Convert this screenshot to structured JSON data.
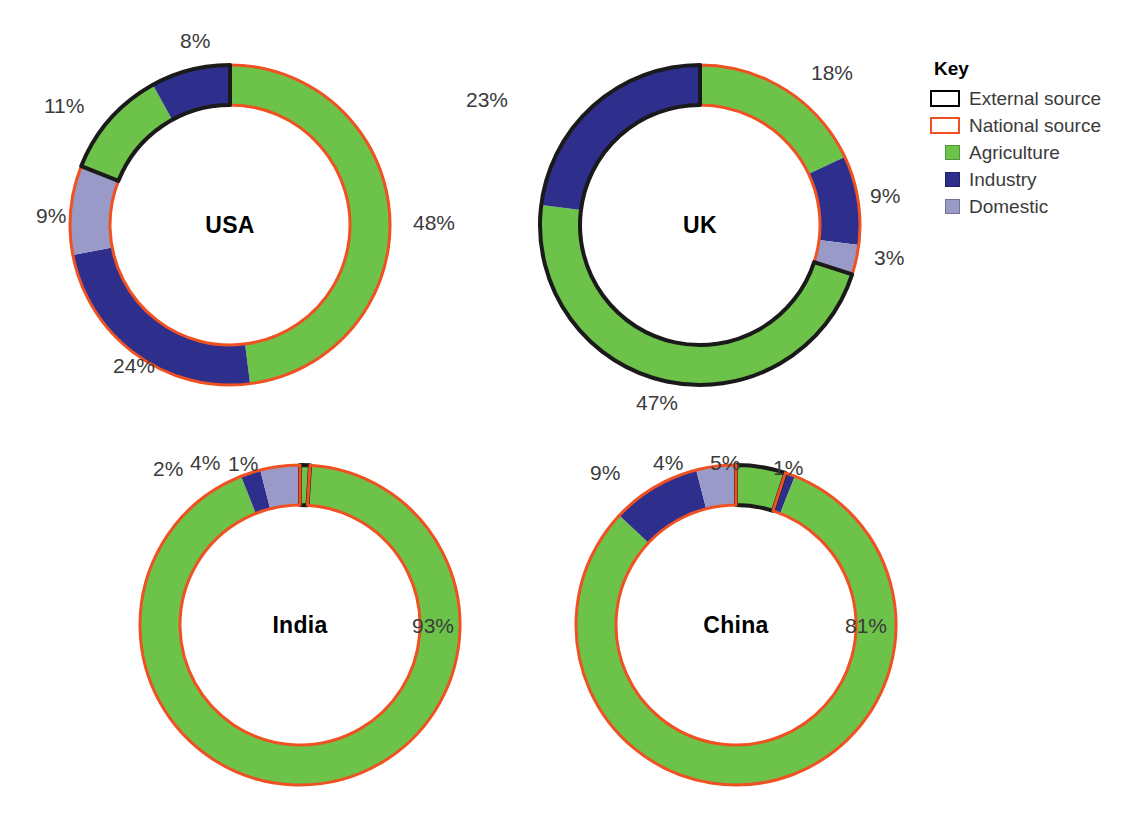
{
  "colors": {
    "agriculture": "#6dc24a",
    "industry": "#2e2e8c",
    "domestic": "#9a9ac8",
    "national_source": "#ef5122",
    "external_source": "#1a1a1a",
    "label_text": "#3b3b3b",
    "background": "#ffffff"
  },
  "legend": {
    "title": "Key",
    "items": [
      {
        "label": "External source",
        "swatch": "outline-black-icon",
        "type": "outline",
        "color": "#1a1a1a"
      },
      {
        "label": "National source",
        "swatch": "outline-orange-icon",
        "type": "outline",
        "color": "#ef5122"
      },
      {
        "label": "Agriculture",
        "swatch": "green-square-icon",
        "type": "fill",
        "color": "#6dc24a"
      },
      {
        "label": "Industry",
        "swatch": "navy-square-icon",
        "type": "fill",
        "color": "#2e2e8c"
      },
      {
        "label": "Domestic",
        "swatch": "lavender-square-icon",
        "type": "fill",
        "color": "#9a9ac8"
      }
    ]
  },
  "chart_data": {
    "type": "pie",
    "title": "",
    "subtitle": "",
    "variant": "donut",
    "note": "Four donut charts of water use by sector; ring outline colour encodes water source (orange = national source, black = external source). Segments are ordered clockwise starting at 12 o'clock.",
    "legend_position": "right",
    "categories": [
      "Agriculture",
      "Industry",
      "Domestic"
    ],
    "source_categories": [
      "National source",
      "External source"
    ],
    "charts": [
      {
        "name": "USA",
        "center_label": "USA",
        "segments": [
          {
            "label": "48%",
            "value": 48,
            "category": "Agriculture",
            "color": "#6dc24a",
            "source": "National source",
            "outline": "#ef5122",
            "start": 0,
            "end": 48
          },
          {
            "label": "24%",
            "value": 24,
            "category": "Industry",
            "color": "#2e2e8c",
            "source": "National source",
            "outline": "#ef5122",
            "start": 48,
            "end": 72
          },
          {
            "label": "9%",
            "value": 9,
            "category": "Domestic",
            "color": "#9a9ac8",
            "source": "National source",
            "outline": "#ef5122",
            "start": 72,
            "end": 81
          },
          {
            "label": "11%",
            "value": 11,
            "category": "Agriculture",
            "color": "#6dc24a",
            "source": "External source",
            "outline": "#1a1a1a",
            "start": 81,
            "end": 92
          },
          {
            "label": "8%",
            "value": 8,
            "category": "Industry",
            "color": "#2e2e8c",
            "source": "External source",
            "outline": "#1a1a1a",
            "start": 92,
            "end": 100
          }
        ]
      },
      {
        "name": "UK",
        "center_label": "UK",
        "segments": [
          {
            "label": "18%",
            "value": 18,
            "category": "Agriculture",
            "color": "#6dc24a",
            "source": "National source",
            "outline": "#ef5122",
            "start": 0,
            "end": 18
          },
          {
            "label": "9%",
            "value": 9,
            "category": "Industry",
            "color": "#2e2e8c",
            "source": "National source",
            "outline": "#ef5122",
            "start": 18,
            "end": 27
          },
          {
            "label": "3%",
            "value": 3,
            "category": "Domestic",
            "color": "#9a9ac8",
            "source": "National source",
            "outline": "#ef5122",
            "start": 27,
            "end": 30
          },
          {
            "label": "47%",
            "value": 47,
            "category": "Agriculture",
            "color": "#6dc24a",
            "source": "External source",
            "outline": "#1a1a1a",
            "start": 30,
            "end": 77
          },
          {
            "label": "23%",
            "value": 23,
            "category": "Industry",
            "color": "#2e2e8c",
            "source": "External source",
            "outline": "#1a1a1a",
            "start": 77,
            "end": 100
          }
        ]
      },
      {
        "name": "India",
        "center_label": "India",
        "segments": [
          {
            "label": "1%",
            "value": 1,
            "category": "Agriculture",
            "color": "#6dc24a",
            "source": "External source",
            "outline": "#1a1a1a",
            "start": 0,
            "end": 1
          },
          {
            "label": "93%",
            "value": 93,
            "category": "Agriculture",
            "color": "#6dc24a",
            "source": "National source",
            "outline": "#ef5122",
            "start": 1,
            "end": 94
          },
          {
            "label": "2%",
            "value": 2,
            "category": "Industry",
            "color": "#2e2e8c",
            "source": "National source",
            "outline": "#ef5122",
            "start": 94,
            "end": 96
          },
          {
            "label": "4%",
            "value": 4,
            "category": "Domestic",
            "color": "#9a9ac8",
            "source": "National source",
            "outline": "#ef5122",
            "start": 96,
            "end": 100
          }
        ]
      },
      {
        "name": "China",
        "center_label": "China",
        "segments": [
          {
            "label": "5%",
            "value": 5,
            "category": "Agriculture",
            "color": "#6dc24a",
            "source": "External source",
            "outline": "#1a1a1a",
            "start": 0,
            "end": 5
          },
          {
            "label": "1%",
            "value": 1,
            "category": "Industry",
            "color": "#2e2e8c",
            "source": "National source",
            "outline": "#ef5122",
            "start": 5,
            "end": 6
          },
          {
            "label": "81%",
            "value": 81,
            "category": "Agriculture",
            "color": "#6dc24a",
            "source": "National source",
            "outline": "#ef5122",
            "start": 6,
            "end": 87
          },
          {
            "label": "9%",
            "value": 9,
            "category": "Industry",
            "color": "#2e2e8c",
            "source": "National source",
            "outline": "#ef5122",
            "start": 87,
            "end": 96
          },
          {
            "label": "4%",
            "value": 4,
            "category": "Domestic",
            "color": "#9a9ac8",
            "source": "National source",
            "outline": "#ef5122",
            "start": 96,
            "end": 100
          }
        ]
      }
    ]
  },
  "layout": {
    "panels": [
      {
        "key": "usa",
        "cx": 230,
        "cy": 225,
        "r_outer": 168,
        "r_inner": 126,
        "labels": [
          {
            "text_path": "0",
            "x": 415,
            "y": 215
          },
          {
            "text_path": "1",
            "x": 115,
            "y": 355
          },
          {
            "text_path": "2",
            "x": 40,
            "y": 208
          },
          {
            "text_path": "3",
            "x": 44,
            "y": 96
          },
          {
            "text_path": "4",
            "x": 180,
            "y": 34
          }
        ]
      },
      {
        "key": "uk",
        "cx": 700,
        "cy": 225,
        "r_outer": 168,
        "r_inner": 126,
        "labels": [
          {
            "text_path": "0",
            "x": 812,
            "y": 66
          },
          {
            "text_path": "1",
            "x": 872,
            "y": 187
          },
          {
            "text_path": "2",
            "x": 875,
            "y": 248
          },
          {
            "text_path": "3",
            "x": 637,
            "y": 395
          },
          {
            "text_path": "4",
            "x": 470,
            "y": 93
          }
        ]
      },
      {
        "key": "india",
        "cx": 300,
        "cy": 625,
        "r_outer": 168,
        "r_inner": 126,
        "labels": [
          {
            "text_path": "0",
            "x": 232,
            "y": 455
          },
          {
            "text_path": "1",
            "x": 412,
            "y": 614
          },
          {
            "text_path": "2",
            "x": 157,
            "y": 455
          },
          {
            "text_path": "3",
            "x": 192,
            "y": 453
          }
        ]
      },
      {
        "key": "china",
        "cx": 736,
        "cy": 625,
        "r_outer": 168,
        "r_inner": 126,
        "labels": [
          {
            "text_path": "0",
            "x": 713,
            "y": 453
          },
          {
            "text_path": "1",
            "x": 775,
            "y": 456
          },
          {
            "text_path": "2",
            "x": 847,
            "y": 614
          },
          {
            "text_path": "3",
            "x": 592,
            "y": 462
          },
          {
            "text_path": "4",
            "x": 655,
            "y": 453
          }
        ]
      }
    ]
  }
}
